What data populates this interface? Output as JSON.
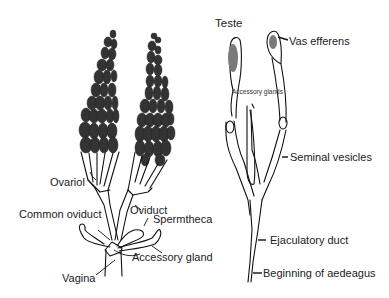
{
  "figure": {
    "female_panel": {
      "labels": [
        {
          "id": "ovariol",
          "text": "Ovariol"
        },
        {
          "id": "common_oviduct",
          "text": "Common oviduct"
        },
        {
          "id": "oviduct",
          "text": "Oviduct"
        },
        {
          "id": "spermtheca",
          "text": "Spermtheca"
        },
        {
          "id": "accessory_gland",
          "text": "Accessory gland"
        },
        {
          "id": "vagina",
          "text": "Vagina"
        }
      ]
    },
    "male_panel": {
      "labels": [
        {
          "id": "teste",
          "text": "Teste"
        },
        {
          "id": "vas_efferens",
          "text": "Vas efferens"
        },
        {
          "id": "accessory_glands",
          "text": "Accessory glands"
        },
        {
          "id": "seminal_vesicles",
          "text": "Seminal vesicles"
        },
        {
          "id": "ejaculatory_duct",
          "text": "Ejaculatory duct"
        },
        {
          "id": "beginning_of_aedeagus",
          "text": "Beginning of aedeagus"
        }
      ]
    },
    "colors": {
      "background": "#ffffff",
      "line": "#111111",
      "oocyte_fill": "#333333",
      "testis_fill": "#7a7a7a",
      "label_text": "#222222"
    }
  }
}
